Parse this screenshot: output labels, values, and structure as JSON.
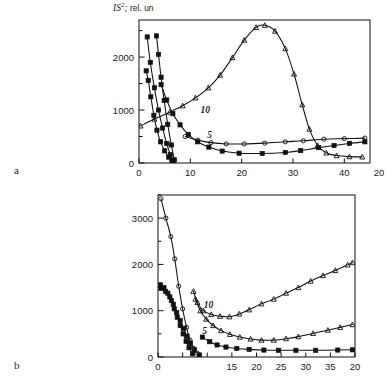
{
  "figure": {
    "axis_title": {
      "symbol": "IS",
      "exponent": "2",
      "sub": ";",
      "units": "rel. un"
    },
    "panels": [
      {
        "letter": "a"
      },
      {
        "letter": "b"
      }
    ]
  },
  "chart_data": [
    {
      "type": "line",
      "panel": "a",
      "title": "",
      "xlabel": "",
      "ylabel": "IS2, rel. un",
      "xlim": [
        0,
        45
      ],
      "ylim": [
        0,
        2700
      ],
      "xticks": [
        0,
        10,
        20,
        30,
        40
      ],
      "xticklabels": [
        "0",
        "10",
        "20",
        "30",
        "40"
      ],
      "xtick_extra_label": "20",
      "yticks": [
        0,
        500,
        1000,
        1500,
        2000,
        2500
      ],
      "yticklabels": [
        "0",
        "",
        "1000",
        "",
        "2000",
        ""
      ],
      "grid": false,
      "legend": "inline-curve-labels",
      "annotations": [
        {
          "text": "10",
          "x": 12.0,
          "y": 950
        },
        {
          "text": "5",
          "x": 13.3,
          "y": 470
        }
      ],
      "series": [
        {
          "name": "steep-decay-A",
          "marker": "square",
          "x": [
            1.4,
            1.8,
            2.3,
            2.9,
            3.5,
            4.2,
            5.0,
            5.8,
            6.4
          ],
          "values": [
            1740,
            1560,
            1250,
            900,
            620,
            400,
            230,
            110,
            50
          ]
        },
        {
          "name": "steep-decay-B",
          "marker": "square",
          "x": [
            1.6,
            2.2,
            3.0,
            3.8,
            4.6,
            5.4,
            6.1,
            6.7
          ],
          "values": [
            2380,
            1900,
            1420,
            1000,
            660,
            370,
            160,
            45
          ]
        },
        {
          "name": "steep-decay-C",
          "marker": "square",
          "x": [
            3.4,
            3.8,
            4.3,
            4.9,
            5.6,
            6.3,
            6.9
          ],
          "values": [
            2400,
            2050,
            1620,
            1180,
            730,
            340,
            60
          ]
        },
        {
          "name": "curve-5-lower",
          "marker": "square",
          "x": [
            4.3,
            5.4,
            6.6,
            8.0,
            9.6,
            11.4,
            13.6,
            16.2,
            19.5,
            24.0,
            28.5,
            31.5,
            35.0,
            38.0,
            41.0,
            44.0
          ],
          "values": [
            1480,
            1190,
            930,
            720,
            540,
            400,
            300,
            225,
            185,
            180,
            200,
            235,
            290,
            330,
            370,
            400
          ]
        },
        {
          "name": "curve-10-rising",
          "marker": "triangle",
          "x": [
            0.3,
            3.0,
            6.0,
            8.5,
            11.0,
            13.5,
            15.8,
            18.2,
            20.5,
            22.8,
            24.5,
            26.5,
            28.5,
            30.2,
            31.8,
            33.2,
            34.8,
            36.5,
            38.5,
            41.0,
            43.5
          ],
          "values": [
            700,
            830,
            960,
            1080,
            1230,
            1420,
            1660,
            1990,
            2320,
            2560,
            2600,
            2490,
            2160,
            1680,
            1100,
            640,
            330,
            190,
            140,
            120,
            115
          ]
        },
        {
          "name": "curve-flat-upper",
          "marker": "circle",
          "x": [
            9.0,
            11.5,
            14.0,
            17.0,
            20.5,
            24.5,
            28.5,
            32.0,
            36.0,
            40.0,
            44.0
          ],
          "values": [
            500,
            430,
            385,
            360,
            360,
            375,
            400,
            420,
            450,
            460,
            470
          ]
        }
      ]
    },
    {
      "type": "line",
      "panel": "b",
      "title": "",
      "xlabel": "",
      "ylabel": "",
      "xlim": [
        0,
        40
      ],
      "ylim": [
        0,
        3500
      ],
      "xticks": [
        0,
        5,
        10,
        15,
        20,
        25,
        30,
        35,
        40
      ],
      "xticklabels": [
        "0",
        "",
        "",
        "15",
        "20",
        "25",
        "30",
        "35",
        "20"
      ],
      "yticks": [
        0,
        500,
        1000,
        1500,
        2000,
        2500,
        3000,
        3500
      ],
      "yticklabels": [
        "0",
        "",
        "1000",
        "",
        "2000",
        "",
        "3000",
        ""
      ],
      "grid": false,
      "legend": "inline-curve-labels",
      "annotations": [
        {
          "text": "10",
          "x": 9.3,
          "y": 1060
        },
        {
          "text": "5",
          "x": 9.0,
          "y": 500
        }
      ],
      "series": [
        {
          "name": "steep-decay-top",
          "marker": "circle",
          "x": [
            0.6,
            1.6,
            2.6,
            3.4,
            4.2,
            5.0,
            5.8,
            6.5,
            7.2,
            8.0
          ],
          "values": [
            3420,
            3000,
            2600,
            2120,
            1530,
            1040,
            640,
            360,
            190,
            80
          ]
        },
        {
          "name": "steep-decay-mid-A",
          "marker": "square",
          "x": [
            0.5,
            1.2,
            2.0,
            2.7,
            3.3,
            3.9,
            4.5,
            5.1,
            5.7,
            6.3,
            7.0
          ],
          "values": [
            1560,
            1500,
            1380,
            1220,
            1040,
            860,
            680,
            500,
            340,
            200,
            70
          ]
        },
        {
          "name": "steep-decay-mid-B",
          "marker": "square",
          "x": [
            0.6,
            1.5,
            2.4,
            3.1,
            3.8,
            4.5,
            5.2,
            5.9,
            6.6,
            7.4,
            8.4
          ],
          "values": [
            1480,
            1420,
            1300,
            1140,
            960,
            790,
            620,
            450,
            300,
            160,
            45
          ]
        },
        {
          "name": "curve-10-rising",
          "marker": "triangle",
          "x": [
            7.2,
            8.0,
            9.2,
            10.8,
            12.6,
            14.5,
            16.5,
            18.5,
            21.0,
            23.5,
            26.0,
            28.5,
            31.0,
            33.5,
            36.0,
            38.5,
            39.5
          ],
          "values": [
            1420,
            1180,
            1000,
            920,
            880,
            870,
            930,
            1020,
            1150,
            1250,
            1380,
            1500,
            1640,
            1760,
            1870,
            1990,
            2040
          ]
        },
        {
          "name": "curve-5-mid",
          "marker": "triangle",
          "x": [
            7.6,
            8.6,
            9.8,
            11.2,
            12.8,
            14.6,
            16.6,
            18.8,
            21.0,
            23.5,
            26.0,
            28.5,
            31.5,
            34.5,
            37.0,
            39.5
          ],
          "values": [
            1250,
            1000,
            820,
            680,
            570,
            490,
            430,
            390,
            365,
            365,
            395,
            440,
            510,
            580,
            640,
            700
          ]
        },
        {
          "name": "curve-flat-bottom",
          "marker": "square",
          "x": [
            9.0,
            10.5,
            12.0,
            13.8,
            16.0,
            18.5,
            21.5,
            24.5,
            28.0,
            32.0,
            36.5,
            39.5
          ],
          "values": [
            430,
            330,
            260,
            215,
            185,
            165,
            150,
            145,
            145,
            145,
            150,
            155
          ]
        }
      ]
    }
  ]
}
